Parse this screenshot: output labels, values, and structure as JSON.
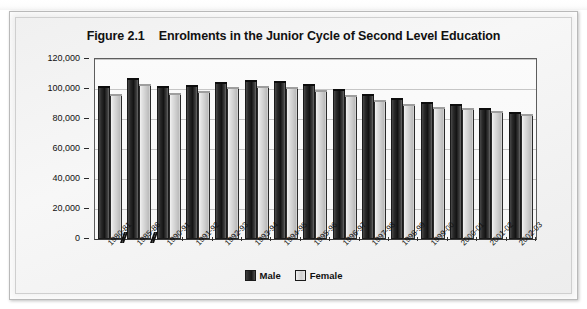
{
  "figure": {
    "number": "Figure 2.1",
    "title": "Enrolments in the Junior Cycle of Second Level Education"
  },
  "legend": {
    "male_label": "Male",
    "female_label": "Female"
  },
  "colors": {
    "male": "#1a1a1a",
    "female": "#d4d4d4",
    "frame": "#b9b9b9",
    "plot_background": "#f8f8f8",
    "gridline": "#9a9a9a"
  },
  "chart_data": {
    "type": "bar",
    "xlabel": "",
    "ylabel": "",
    "ylim": [
      0,
      120000
    ],
    "yticks": [
      0,
      20000,
      40000,
      60000,
      80000,
      100000,
      120000
    ],
    "ytick_labels": [
      "0",
      "20,000",
      "40,000",
      "60,000",
      "80,000",
      "100,000",
      "120,000"
    ],
    "grid": true,
    "legend_position": "bottom",
    "axis_breaks_after": [
      "1980-81",
      "1985-86"
    ],
    "categories": [
      "1980-81",
      "1985-86",
      "1990-91",
      "1991-92",
      "1992-93",
      "1993-94",
      "1994-95",
      "1995-96",
      "1996-97",
      "1997-98",
      "1998-99",
      "1999-00",
      "2000-01",
      "2001-02",
      "2002-03"
    ],
    "series": [
      {
        "name": "Male",
        "values": [
          101800,
          107500,
          102300,
          102700,
          104500,
          105800,
          105400,
          103300,
          100300,
          97000,
          94000,
          91600,
          89700,
          87100,
          85000
        ]
      },
      {
        "name": "Female",
        "values": [
          96900,
          103500,
          97300,
          99000,
          101300,
          102200,
          101100,
          99300,
          96200,
          93000,
          89900,
          88300,
          87300,
          85400,
          83500
        ]
      }
    ]
  }
}
